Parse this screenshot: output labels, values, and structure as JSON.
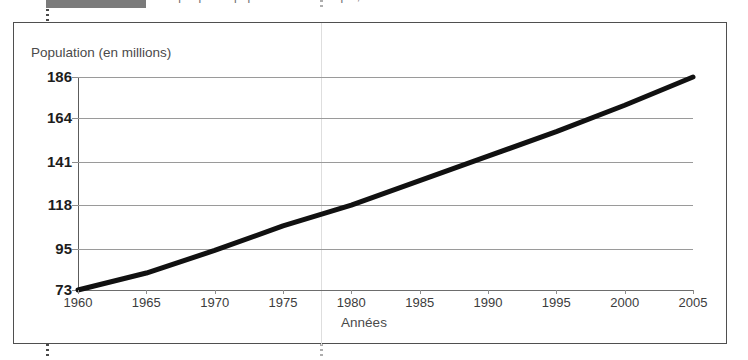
{
  "header": {
    "badge_label": "",
    "clipped_text": "Graphique — population du Mexique, 1960 à 2005"
  },
  "figure": {
    "y_axis_title": "Population (en millions)",
    "x_axis_title": "Années"
  },
  "colors": {
    "line": "#111111",
    "grid": "#9a9a9a",
    "axis": "#5c5c5c",
    "frame": "#4f4f4f",
    "label_text": "#3c3c3c",
    "tick_text": "#1d1d1d"
  },
  "chart_data": {
    "type": "line",
    "title": "",
    "xlabel": "Années",
    "ylabel": "Population (en millions)",
    "xlim": [
      1960,
      2005
    ],
    "ylim": [
      73,
      186
    ],
    "grid": true,
    "legend": "none",
    "xticks": [
      1960,
      1965,
      1970,
      1975,
      1980,
      1985,
      1990,
      1995,
      2000,
      2005
    ],
    "yticks": [
      73,
      95,
      118,
      141,
      164,
      186
    ],
    "x": [
      1960,
      1965,
      1970,
      1975,
      1980,
      1985,
      1990,
      1995,
      2000,
      2005
    ],
    "series": [
      {
        "name": "Population",
        "values": [
          73,
          82,
          94,
          107,
          118,
          131,
          144,
          157,
          171,
          186
        ]
      }
    ]
  }
}
